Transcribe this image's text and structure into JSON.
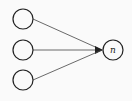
{
  "diagram": {
    "type": "neural-network-fan-in",
    "inputs": [
      {
        "id": "input-1",
        "label": ""
      },
      {
        "id": "input-2",
        "label": ""
      },
      {
        "id": "input-3",
        "label": ""
      }
    ],
    "output": {
      "id": "output",
      "label": "n"
    },
    "colors": {
      "stroke": "#222222",
      "background": "#fafafa"
    }
  }
}
